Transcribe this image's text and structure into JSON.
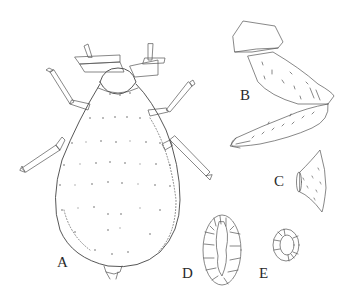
{
  "figure": {
    "panels": [
      {
        "id": "A",
        "label": "A",
        "subject": "whole body, dorsal view"
      },
      {
        "id": "B",
        "label": "B",
        "subject": "leg (coxa, femur, tibia)"
      },
      {
        "id": "C",
        "label": "C",
        "subject": "cone-shaped structure (siphunculus)"
      },
      {
        "id": "D",
        "label": "D",
        "subject": "oval cellular plate"
      },
      {
        "id": "E",
        "label": "E",
        "subject": "small ring-shaped pore"
      }
    ],
    "colors": {
      "background": "#ffffff",
      "line": "#555555",
      "label": "#2a2a2a"
    }
  }
}
